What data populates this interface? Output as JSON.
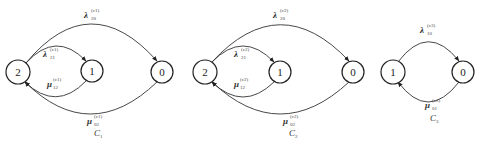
{
  "diagram": {
    "panels": [
      {
        "caption": "C",
        "caption_sub": "1",
        "nodes": [
          {
            "label": "2",
            "cx": 18,
            "cy": 72
          },
          {
            "label": "1",
            "cx": 92,
            "cy": 71
          },
          {
            "label": "0",
            "cx": 162,
            "cy": 72
          }
        ],
        "edges": [
          {
            "symbol": "λ",
            "sub": "20",
            "sup": "(c1)"
          },
          {
            "symbol": "λ",
            "sub": "21",
            "sup": "(c1)"
          },
          {
            "symbol": "μ",
            "sub": "12",
            "sup": "(c1)"
          },
          {
            "symbol": "μ",
            "sub": "02",
            "sup": "(c1)"
          }
        ]
      },
      {
        "caption": "C",
        "caption_sub": "2",
        "nodes": [
          {
            "label": "2",
            "cx": 205,
            "cy": 72
          },
          {
            "label": "1",
            "cx": 280,
            "cy": 72
          },
          {
            "label": "0",
            "cx": 353,
            "cy": 72
          }
        ],
        "edges": [
          {
            "symbol": "λ",
            "sub": "20",
            "sup": "(c2)"
          },
          {
            "symbol": "λ",
            "sub": "21",
            "sup": "(c2)"
          },
          {
            "symbol": "μ",
            "sub": "12",
            "sup": "(c2)"
          },
          {
            "symbol": "μ",
            "sub": "02",
            "sup": "(c2)"
          }
        ]
      },
      {
        "caption": "C",
        "caption_sub": "3",
        "nodes": [
          {
            "label": "1",
            "cx": 393,
            "cy": 72
          },
          {
            "label": "0",
            "cx": 463,
            "cy": 72
          }
        ],
        "edges": [
          {
            "symbol": "λ",
            "sub": "10",
            "sup": "(c3)"
          },
          {
            "symbol": "μ",
            "sub": "01",
            "sup": "(c3)"
          }
        ]
      }
    ]
  }
}
